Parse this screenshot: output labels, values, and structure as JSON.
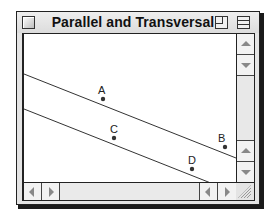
{
  "window": {
    "title": "Parallel and Transversal"
  },
  "figure": {
    "lines": [
      {
        "name": "line-AB",
        "x1": 0,
        "y1": 40,
        "x2": 212,
        "y2": 124
      },
      {
        "name": "line-CD",
        "x1": 0,
        "y1": 75,
        "x2": 212,
        "y2": 159
      }
    ],
    "points": [
      {
        "label": "A",
        "x": 79,
        "y": 65,
        "lx": 74,
        "ly": 51
      },
      {
        "label": "B",
        "x": 201,
        "y": 113,
        "lx": 194,
        "ly": 99
      },
      {
        "label": "C",
        "x": 90,
        "y": 104,
        "lx": 86,
        "ly": 90
      },
      {
        "label": "D",
        "x": 168,
        "y": 135,
        "lx": 164,
        "ly": 121
      }
    ],
    "line_color": "#333333",
    "point_color": "#333333"
  },
  "icons": {
    "close": "close-box-icon",
    "zoom": "zoom-box-icon",
    "collapse": "collapse-box-icon",
    "scroll_up": "arrow-up-icon",
    "scroll_down": "arrow-down-icon",
    "scroll_left": "arrow-left-icon",
    "scroll_right": "arrow-right-icon",
    "resize": "resize-grip-icon"
  }
}
